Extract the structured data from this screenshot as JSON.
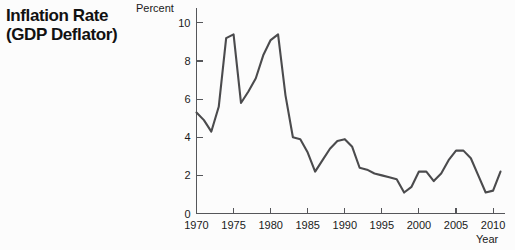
{
  "figure": {
    "title_line_1": "Inflation Rate",
    "title_line_2": "(GDP Deflator)",
    "background_color": "#fcfcfc",
    "line_color": "#4b4b4d",
    "axis_color": "#55565a"
  },
  "chart_data": {
    "type": "line",
    "title": "Inflation Rate (GDP Deflator)",
    "xlabel": "Year",
    "ylabel": "Percent",
    "xlim": [
      1970,
      2011
    ],
    "ylim": [
      0,
      10.6
    ],
    "grid": false,
    "legend": "none",
    "y_ticks": [
      0,
      2,
      4,
      6,
      8,
      10
    ],
    "y_tick_labels": [
      "0",
      "2",
      "4",
      "6",
      "8",
      "10"
    ],
    "x_ticks": [
      1970,
      1975,
      1980,
      1985,
      1990,
      1995,
      2000,
      2005,
      2010
    ],
    "x_tick_labels": [
      "1970",
      "1975",
      "1980",
      "1985",
      "1990",
      "1995",
      "2000",
      "2005",
      "2010"
    ],
    "series": [
      {
        "name": "GDP Deflator Inflation Rate",
        "x": [
          1970,
          1971,
          1972,
          1973,
          1974,
          1975,
          1976,
          1977,
          1978,
          1979,
          1980,
          1981,
          1982,
          1983,
          1984,
          1985,
          1986,
          1987,
          1988,
          1989,
          1990,
          1991,
          1992,
          1993,
          1994,
          1995,
          1996,
          1997,
          1998,
          1999,
          2000,
          2001,
          2002,
          2003,
          2004,
          2005,
          2006,
          2007,
          2008,
          2009,
          2010,
          2011
        ],
        "values": [
          5.3,
          4.9,
          4.3,
          5.6,
          9.2,
          9.4,
          5.8,
          6.4,
          7.1,
          8.3,
          9.1,
          9.4,
          6.2,
          4.0,
          3.9,
          3.2,
          2.2,
          2.8,
          3.4,
          3.8,
          3.9,
          3.5,
          2.4,
          2.3,
          2.1,
          2.0,
          1.9,
          1.8,
          1.1,
          1.4,
          2.2,
          2.2,
          1.7,
          2.1,
          2.8,
          3.3,
          3.3,
          2.9,
          2.0,
          1.1,
          1.2,
          2.2
        ]
      }
    ]
  }
}
